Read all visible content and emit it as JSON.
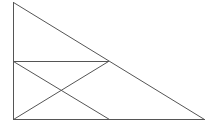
{
  "diagram": {
    "type": "geometry",
    "stroke_color": "#555555",
    "background": "#ffffff",
    "points": {
      "top": [
        13,
        2
      ],
      "mid_left": [
        13,
        61
      ],
      "mid_right": [
        108,
        61
      ],
      "bottom_left": [
        13,
        119
      ],
      "bottom_mid": [
        109,
        119
      ],
      "bottom_right": [
        204,
        119
      ]
    },
    "segments": [
      {
        "name": "left-side",
        "from": "top",
        "to": "bottom_left"
      },
      {
        "name": "base",
        "from": "bottom_left",
        "to": "bottom_right"
      },
      {
        "name": "hypotenuse",
        "from": "top",
        "to": "bottom_right"
      },
      {
        "name": "midline",
        "from": "mid_left",
        "to": "mid_right"
      },
      {
        "name": "diagonal-down",
        "from": "mid_left",
        "to": "bottom_mid"
      },
      {
        "name": "diagonal-up",
        "from": "bottom_left",
        "to": "mid_right"
      }
    ]
  }
}
